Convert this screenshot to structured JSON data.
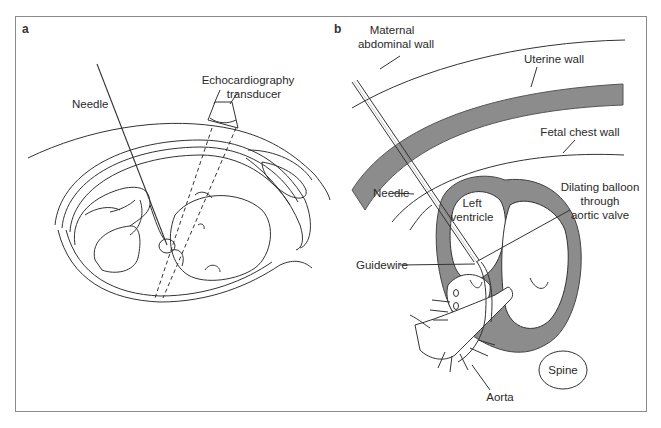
{
  "figure": {
    "panels": [
      {
        "id": "a",
        "letter": "a",
        "labels": {
          "needle": "Needle",
          "transducer_line1": "Echocardiography",
          "transducer_line2": "transducer"
        }
      },
      {
        "id": "b",
        "letter": "b",
        "labels": {
          "maternal_line1": "Maternal",
          "maternal_line2": "abdominal wall",
          "uterine_wall": "Uterine wall",
          "fetal_chest_wall": "Fetal chest wall",
          "needle": "Needle",
          "left_ventricle_line1": "Left",
          "left_ventricle_line2": "ventricle",
          "balloon_line1": "Dilating balloon",
          "balloon_line2": "through",
          "balloon_line3": "aortic valve",
          "guidewire": "Guidewire",
          "spine": "Spine",
          "aorta": "Aorta"
        }
      }
    ],
    "colors": {
      "line": "#333333",
      "tissue_fill": "#8c8c8c",
      "frame": "#8a8a8a",
      "background": "#ffffff"
    }
  }
}
